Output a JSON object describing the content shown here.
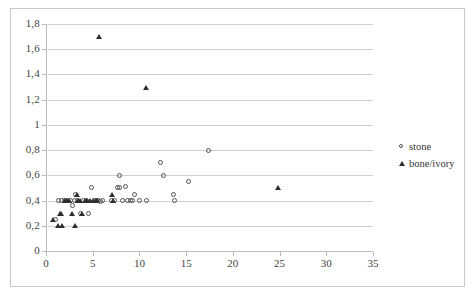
{
  "chart_data": {
    "type": "scatter",
    "title": "",
    "xlabel": "",
    "ylabel": "",
    "xlim": [
      0,
      35
    ],
    "ylim": [
      0,
      1.8
    ],
    "xticks": [
      0,
      5,
      10,
      15,
      20,
      25,
      30,
      35
    ],
    "yticks": [
      0,
      0.2,
      0.4,
      0.6,
      0.8,
      1,
      1.2,
      1.4,
      1.6,
      1.8
    ],
    "xtick_labels": [
      "0",
      "5",
      "10",
      "15",
      "20",
      "25",
      "30",
      "35"
    ],
    "ytick_labels": [
      "0",
      "0,2",
      "0,4",
      "0,6",
      "0,8",
      "1",
      "1,2",
      "1,4",
      "1,6",
      "1,8"
    ],
    "decimal_separator": ",",
    "grid": "horizontal",
    "legend_position": "right",
    "series": [
      {
        "name": "stone",
        "marker": "open-circle",
        "color": "#545454",
        "points": [
          [
            1.0,
            0.25
          ],
          [
            1.3,
            0.4
          ],
          [
            1.7,
            0.4
          ],
          [
            2.0,
            0.4
          ],
          [
            2.3,
            0.4
          ],
          [
            2.6,
            0.4
          ],
          [
            2.8,
            0.36
          ],
          [
            3.0,
            0.4
          ],
          [
            3.2,
            0.45
          ],
          [
            3.4,
            0.4
          ],
          [
            3.7,
            0.3
          ],
          [
            4.0,
            0.4
          ],
          [
            4.3,
            0.4
          ],
          [
            4.6,
            0.3
          ],
          [
            4.9,
            0.5
          ],
          [
            5.2,
            0.4
          ],
          [
            5.4,
            0.4
          ],
          [
            5.6,
            0.4
          ],
          [
            5.8,
            0.39
          ],
          [
            6.0,
            0.4
          ],
          [
            7.0,
            0.4
          ],
          [
            7.3,
            0.4
          ],
          [
            7.6,
            0.5
          ],
          [
            7.9,
            0.5
          ],
          [
            7.9,
            0.6
          ],
          [
            8.2,
            0.4
          ],
          [
            8.5,
            0.51
          ],
          [
            8.7,
            0.4
          ],
          [
            9.0,
            0.4
          ],
          [
            9.3,
            0.4
          ],
          [
            9.5,
            0.45
          ],
          [
            10.0,
            0.4
          ],
          [
            10.8,
            0.4
          ],
          [
            12.3,
            0.7
          ],
          [
            12.6,
            0.6
          ],
          [
            13.6,
            0.45
          ],
          [
            13.8,
            0.4
          ],
          [
            15.2,
            0.55
          ],
          [
            17.4,
            0.8
          ]
        ]
      },
      {
        "name": "bone/ivory",
        "marker": "filled-triangle",
        "color": "#2e2e2e",
        "points": [
          [
            0.8,
            0.25
          ],
          [
            1.3,
            0.2
          ],
          [
            1.5,
            0.3
          ],
          [
            1.6,
            0.3
          ],
          [
            1.7,
            0.2
          ],
          [
            2.0,
            0.4
          ],
          [
            2.2,
            0.4
          ],
          [
            2.5,
            0.4
          ],
          [
            2.8,
            0.3
          ],
          [
            3.1,
            0.2
          ],
          [
            3.3,
            0.45
          ],
          [
            3.4,
            0.4
          ],
          [
            3.6,
            0.4
          ],
          [
            3.9,
            0.3
          ],
          [
            4.2,
            0.4
          ],
          [
            4.4,
            0.4
          ],
          [
            4.7,
            0.4
          ],
          [
            5.0,
            0.4
          ],
          [
            5.3,
            0.4
          ],
          [
            5.5,
            0.4
          ],
          [
            5.7,
            1.7
          ],
          [
            7.1,
            0.45
          ],
          [
            7.2,
            0.4
          ],
          [
            10.7,
            1.3
          ],
          [
            24.8,
            0.5
          ]
        ]
      }
    ]
  },
  "legend": {
    "items": [
      {
        "label": "stone",
        "marker": "open-circle"
      },
      {
        "label": "bone/ivory",
        "marker": "filled-triangle"
      }
    ]
  }
}
